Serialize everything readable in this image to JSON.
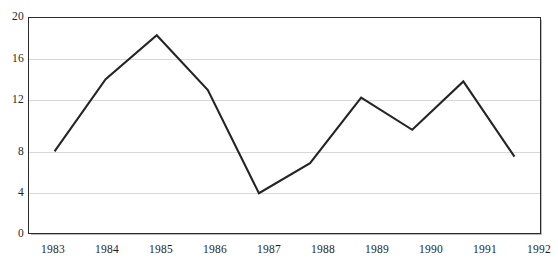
{
  "chart_data": {
    "type": "line",
    "title": "",
    "subtitle": "",
    "xlabel": "",
    "ylabel": "",
    "categories": [
      "1983",
      "1984",
      "1985",
      "1986",
      "1987",
      "1988",
      "1989",
      "1990",
      "1991",
      "1992"
    ],
    "values": [
      7.6,
      14.3,
      18.4,
      13.3,
      3.7,
      6.5,
      12.6,
      9.6,
      14.1,
      7.1
    ],
    "series": [
      {
        "name": "",
        "values": [
          7.6,
          14.3,
          18.4,
          13.3,
          3.7,
          6.5,
          12.6,
          9.6,
          14.1,
          7.1
        ]
      }
    ],
    "ylim": [
      0,
      20
    ],
    "y_ticks": [
      0,
      4,
      8,
      12,
      16,
      20
    ],
    "y_tick_labels": [
      "0",
      "4",
      "8",
      "12",
      "16",
      "20"
    ],
    "x_tick_labels": [
      "1983",
      "1984",
      "1985",
      "1986",
      "1987",
      "1988",
      "1989",
      "1990",
      "1991",
      "1992"
    ],
    "grid": "horizontal",
    "legend": "none",
    "annotations": [],
    "colors": {
      "line": "#242424",
      "gridline": "#d8d8d8",
      "frame": "#2b2b2b",
      "background": "#ffffff",
      "text": "#1f1f1f"
    }
  },
  "caption": {
    "remnant_text": ""
  }
}
